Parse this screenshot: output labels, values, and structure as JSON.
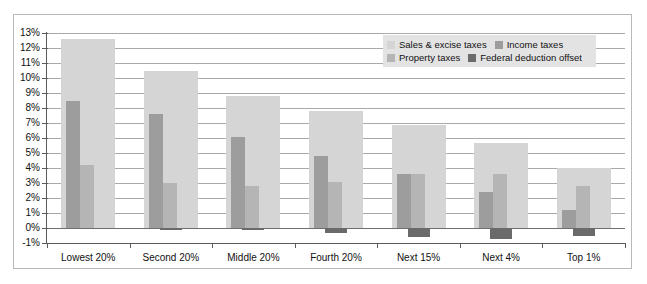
{
  "chart_data": {
    "type": "bar",
    "title": "",
    "subtitle": "",
    "xlabel": "",
    "ylabel": "",
    "ylim": [
      -1,
      13
    ],
    "ytick_step": 1,
    "ytick_labels": [
      "13%",
      "12%",
      "11%",
      "10%",
      "9%",
      "8%",
      "7%",
      "6%",
      "5%",
      "4%",
      "3%",
      "2%",
      "1%",
      "0%",
      "-1%"
    ],
    "ytick_values": [
      13,
      12,
      11,
      10,
      9,
      8,
      7,
      6,
      5,
      4,
      3,
      2,
      1,
      0,
      -1
    ],
    "grid": true,
    "legend_position": "top-right",
    "categories": [
      "Lowest 20%",
      "Second 20%",
      "Middle 20%",
      "Fourth 20%",
      "Next 15%",
      "Next 4%",
      "Top 1%"
    ],
    "series": [
      {
        "name": "Sales & excise taxes",
        "color": "#d5d5d5",
        "values": [
          12.6,
          10.5,
          8.8,
          7.8,
          6.9,
          5.7,
          4.0
        ]
      },
      {
        "name": "Income taxes",
        "color": "#9d9d9d",
        "values": [
          8.5,
          7.6,
          6.1,
          4.8,
          3.6,
          2.4,
          1.2
        ]
      },
      {
        "name": "Property taxes",
        "color": "#b5b5b5",
        "values": [
          4.2,
          3.0,
          2.8,
          3.1,
          3.6,
          3.6,
          2.8
        ]
      },
      {
        "name": "Federal deduction offset",
        "color": "#6a6a6a",
        "values": [
          0.0,
          -0.1,
          -0.1,
          -0.3,
          -0.6,
          -0.7,
          -0.5
        ]
      }
    ]
  },
  "legend": {
    "items": [
      {
        "label": "Sales & excise taxes",
        "swatch": "sw-sales"
      },
      {
        "label": "Income taxes",
        "swatch": "sw-income"
      },
      {
        "label": "Property taxes",
        "swatch": "sw-prop"
      },
      {
        "label": "Federal deduction offset",
        "swatch": "sw-offset"
      }
    ]
  },
  "colors": {
    "sales_excise": "#d5d5d5",
    "income": "#9d9d9d",
    "property": "#b5b5b5",
    "offset": "#6a6a6a",
    "axis": "#5b5b5b",
    "grid": "#a9a9a9",
    "frame": "#b9b9b9",
    "legend_bg": "#e3e3e3",
    "background": "#ffffff"
  }
}
